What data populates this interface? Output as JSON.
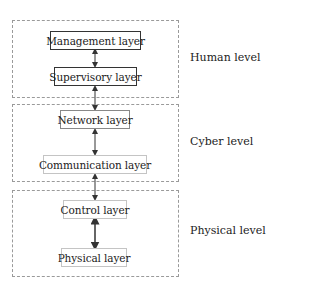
{
  "levels": [
    {
      "label": "Human level",
      "layers": [
        "Management layer",
        "Supervisory layer"
      ]
    },
    {
      "label": "Cyber level",
      "layers": [
        "Network layer",
        "Communication layer"
      ]
    },
    {
      "label": "Physical level",
      "layers": [
        "Control layer",
        "Physical layer"
      ]
    }
  ],
  "connections": "bidirectional arrows between adjacent layers"
}
